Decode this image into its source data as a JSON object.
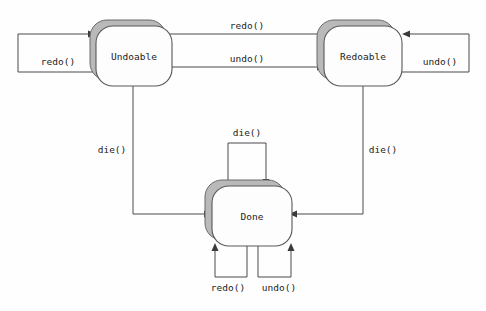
{
  "diagram": {
    "type": "state-diagram",
    "background_color": "#fefefe",
    "line_color": "#4a4a4a",
    "shadow_color": "#b9b9b9",
    "state_fill_color": "#fdfdfd",
    "state_border_color": "#585858",
    "states": [
      {
        "id": "undoable",
        "label": "Undoable",
        "x": 95,
        "y": 25,
        "w": 76,
        "h": 60
      },
      {
        "id": "redoable",
        "label": "Redoable",
        "x": 322,
        "y": 25,
        "w": 78,
        "h": 60
      },
      {
        "id": "done",
        "label": "Done",
        "x": 210,
        "y": 185,
        "w": 80,
        "h": 60
      }
    ],
    "transitions": [
      {
        "id": "undoable-self-redo",
        "label": "redo()",
        "from": "undoable",
        "to": "undoable",
        "label_x": 58,
        "label_y": 62
      },
      {
        "id": "redoable-to-undoable",
        "label": "redo()",
        "from": "redoable",
        "to": "undoable",
        "label_x": 247,
        "label_y": 28
      },
      {
        "id": "undoable-to-redoable",
        "label": "undo()",
        "from": "undoable",
        "to": "redoable",
        "label_x": 247,
        "label_y": 61
      },
      {
        "id": "redoable-self-undo",
        "label": "undo()",
        "from": "redoable",
        "to": "redoable",
        "label_x": 440,
        "label_y": 62
      },
      {
        "id": "undoable-to-done",
        "label": "die()",
        "from": "undoable",
        "to": "done",
        "label_x": 112,
        "label_y": 150
      },
      {
        "id": "redoable-to-done",
        "label": "die()",
        "from": "redoable",
        "to": "done",
        "label_x": 383,
        "label_y": 150
      },
      {
        "id": "done-self-die",
        "label": "die()",
        "from": "done",
        "to": "done",
        "label_x": 247,
        "label_y": 133
      },
      {
        "id": "done-self-redo",
        "label": "redo()",
        "from": "done",
        "to": "done",
        "label_x": 228,
        "label_y": 288
      },
      {
        "id": "done-self-undo",
        "label": "undo()",
        "from": "done",
        "to": "done",
        "label_x": 279,
        "label_y": 288
      }
    ]
  }
}
